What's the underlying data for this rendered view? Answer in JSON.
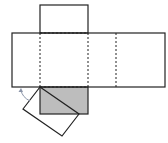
{
  "diagram": {
    "title": "",
    "colors": {
      "stroke": "#222222",
      "shaded_face": "#bdbdbd",
      "arrow": "#8a94a8",
      "background": "#ffffff"
    },
    "shapes": {
      "top_face": {
        "x": 40,
        "y": 5,
        "w": 48,
        "h": 28
      },
      "main_strip": {
        "x": 12,
        "y": 33,
        "w": 153,
        "h": 54
      },
      "fold_lines_x": [
        40,
        88,
        116
      ],
      "shaded_face": {
        "x": 40,
        "y": 87,
        "w": 48,
        "h": 27
      },
      "rotated_face": [
        [
          40,
          87
        ],
        [
          79,
          114
        ],
        [
          62,
          136
        ],
        [
          23,
          109
        ]
      ],
      "arrow": {
        "from": [
          30,
          100
        ],
        "to": [
          20,
          89
        ]
      }
    }
  }
}
